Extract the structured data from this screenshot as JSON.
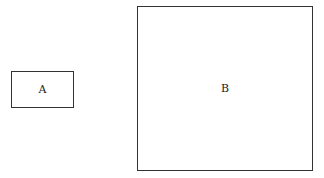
{
  "diagram": {
    "boxes": [
      {
        "id": "A",
        "label": "A"
      },
      {
        "id": "B",
        "label": "B"
      }
    ],
    "colors": {
      "border": "#333333",
      "background": "#ffffff",
      "text": "#222222"
    }
  }
}
